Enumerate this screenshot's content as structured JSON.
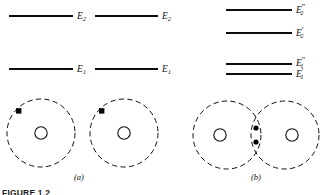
{
  "figure": {
    "caption_partial": "FIGURE 1.2",
    "panels": [
      {
        "id": "a",
        "caption": "(a)",
        "description": "two separated atoms with identical energy levels",
        "levels": [
          {
            "name": "E2-left",
            "label": "E",
            "sub": "2",
            "prime": ""
          },
          {
            "name": "E2-right",
            "label": "E",
            "sub": "2",
            "prime": ""
          },
          {
            "name": "E1-left",
            "label": "E",
            "sub": "1",
            "prime": ""
          },
          {
            "name": "E1-right",
            "label": "E",
            "sub": "1",
            "prime": ""
          }
        ],
        "atoms": [
          {
            "name": "atom-left",
            "electrons": 1
          },
          {
            "name": "atom-right",
            "electrons": 1
          }
        ]
      },
      {
        "id": "b",
        "caption": "(b)",
        "description": "two interacting atoms with split energy levels",
        "levels": [
          {
            "name": "E2-double-prime",
            "label": "E",
            "sub": "2",
            "prime": "″"
          },
          {
            "name": "E2-single-prime",
            "label": "E",
            "sub": "2",
            "prime": "′"
          },
          {
            "name": "E1-double-prime",
            "label": "E",
            "sub": "1",
            "prime": "″"
          },
          {
            "name": "E1-single-prime",
            "label": "E",
            "sub": "1",
            "prime": "′"
          }
        ],
        "atoms": [
          {
            "name": "atom-left",
            "electrons": 0
          },
          {
            "name": "atom-right",
            "electrons": 0
          }
        ],
        "shared_electrons": 2
      }
    ],
    "colors": {
      "ink": "#0d0d0d",
      "background": "#ffffff"
    }
  }
}
